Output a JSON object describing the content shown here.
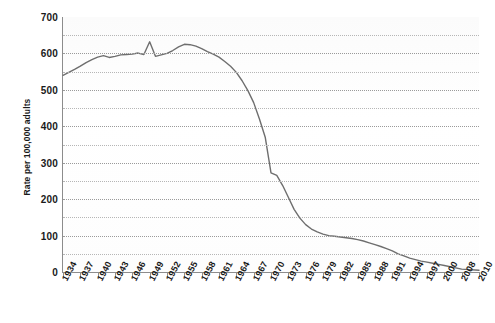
{
  "chart_data": {
    "type": "line",
    "title": "",
    "xlabel": "",
    "ylabel": "Rate per 100,000 adults",
    "ylim": [
      0,
      700
    ],
    "xlim": [
      1934,
      2010
    ],
    "ytick_labels": [
      "700",
      "600",
      "500",
      "400",
      "300",
      "200",
      "100",
      "0"
    ],
    "ytick_values": [
      700,
      600,
      500,
      400,
      300,
      200,
      100,
      0
    ],
    "grid": "horizontal dotted gridlines every 50 units",
    "gridline_values": [
      650,
      600,
      550,
      500,
      450,
      400,
      350,
      300,
      250,
      200,
      150,
      100,
      50
    ],
    "legend": "none",
    "legend_position": "none",
    "line_color": "#6e6e6e",
    "xtick_labels": [
      "1934",
      "1937",
      "1940",
      "1943",
      "1946",
      "1949",
      "1952",
      "1955",
      "1958",
      "1961",
      "1964",
      "1967",
      "1970",
      "1973",
      "1976",
      "1979",
      "1982",
      "1985",
      "1988",
      "1991",
      "1994",
      "1997",
      "2000",
      "2008",
      "2010"
    ],
    "xtick_values": [
      1934,
      1937,
      1940,
      1943,
      1946,
      1949,
      1952,
      1955,
      1958,
      1961,
      1964,
      1967,
      1970,
      1973,
      1976,
      1979,
      1982,
      1985,
      1988,
      1991,
      1994,
      1997,
      2000,
      2008,
      2010
    ],
    "x": [
      1934,
      1935,
      1936,
      1937,
      1938,
      1939,
      1940,
      1941,
      1942,
      1943,
      1944,
      1945,
      1946,
      1947,
      1948,
      1949,
      1950,
      1951,
      1952,
      1953,
      1954,
      1955,
      1956,
      1957,
      1958,
      1959,
      1960,
      1961,
      1962,
      1963,
      1964,
      1965,
      1966,
      1967,
      1968,
      1969,
      1970,
      1971,
      1972,
      1973,
      1974,
      1975,
      1976,
      1977,
      1978,
      1979,
      1980,
      1981,
      1982,
      1983,
      1984,
      1985,
      1986,
      1987,
      1988,
      1989,
      1990,
      1991,
      1992,
      1993,
      1994,
      1995,
      1996,
      1997,
      1998,
      1999,
      2000,
      2008,
      2010
    ],
    "values": [
      540,
      548,
      556,
      565,
      575,
      583,
      590,
      594,
      589,
      592,
      596,
      597,
      598,
      601,
      597,
      632,
      592,
      596,
      600,
      608,
      618,
      625,
      624,
      620,
      613,
      605,
      598,
      590,
      578,
      565,
      548,
      525,
      498,
      465,
      420,
      370,
      272,
      265,
      238,
      205,
      172,
      148,
      130,
      118,
      110,
      104,
      100,
      98,
      96,
      94,
      92,
      89,
      85,
      80,
      75,
      70,
      64,
      58,
      50,
      44,
      38,
      34,
      30,
      27,
      24,
      21,
      18,
      8,
      5
    ],
    "series": [
      {
        "name": "rate",
        "values": [
          540,
          548,
          556,
          565,
          575,
          583,
          590,
          594,
          589,
          592,
          596,
          597,
          598,
          601,
          597,
          632,
          592,
          596,
          600,
          608,
          618,
          625,
          624,
          620,
          613,
          605,
          598,
          590,
          578,
          565,
          548,
          525,
          498,
          465,
          420,
          370,
          272,
          265,
          238,
          205,
          172,
          148,
          130,
          118,
          110,
          104,
          100,
          98,
          96,
          94,
          92,
          89,
          85,
          80,
          75,
          70,
          64,
          58,
          50,
          44,
          38,
          34,
          30,
          27,
          24,
          21,
          18,
          8,
          5
        ]
      }
    ]
  }
}
